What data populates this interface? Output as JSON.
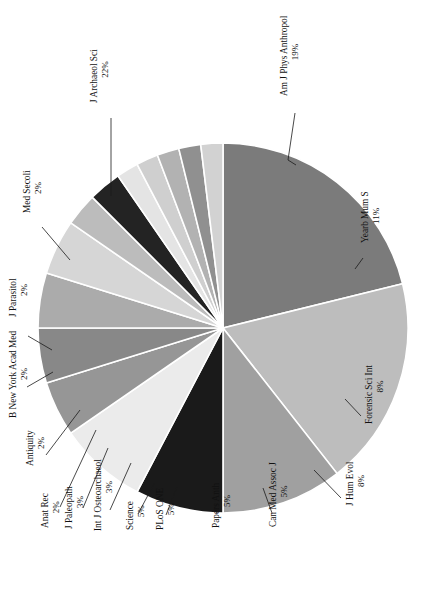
{
  "figure": {
    "name": "journal-distribution-pie-chart",
    "orientation": "rotated-90-ccw",
    "background_color": "#ffffff"
  },
  "chart_data": {
    "type": "pie",
    "title": "",
    "subtitle": "",
    "xlabel": "",
    "ylabel": "",
    "legend_position": "none",
    "labels_position": "outside-with-leader-lines",
    "grid": false,
    "start_angle_deg": 90,
    "direction": "clockwise",
    "total_percent": 100,
    "categories": [
      "J Archaeol Sci",
      "Am J Phys Anthropol",
      "Yearb Mum S",
      "Forensic Sci Int",
      "J Hum Evol",
      "Can Med Assoc J",
      "Papers Anth",
      "PLoS ONE",
      "Science",
      "Int J Osteoarchaeol",
      "J Paleopath",
      "Anat Rec",
      "Antiquity",
      "B New York Acad Med",
      "J Parasitol",
      "Med Secoli"
    ],
    "values": [
      22,
      19,
      11,
      8,
      8,
      5,
      5,
      5,
      5,
      3,
      3,
      2,
      2,
      2,
      2,
      2
    ],
    "value_labels": [
      "22%",
      "19%",
      "11%",
      "8%",
      "8%",
      "5%",
      "5%",
      "5%",
      "5%",
      "3%",
      "3%",
      "2%",
      "2%",
      "2%",
      "2%",
      "2%"
    ],
    "colors": [
      "#7b7b7b",
      "#bdbdbd",
      "#a0a0a0",
      "#1a1a1a",
      "#ebebeb",
      "#969696",
      "#888888",
      "#ababab",
      "#d6d6d6",
      "#bcbcbc",
      "#232323",
      "#e4e4e4",
      "#cfcfcf",
      "#b2b2b2",
      "#909090",
      "#d2d2d2"
    ],
    "slices": [
      {
        "label": "J Archaeol Sci",
        "value": 22,
        "value_label": "22%",
        "color": "#7b7b7b"
      },
      {
        "label": "Am J Phys Anthropol",
        "value": 19,
        "value_label": "19%",
        "color": "#bdbdbd"
      },
      {
        "label": "Yearb Mum S",
        "value": 11,
        "value_label": "11%",
        "color": "#a0a0a0"
      },
      {
        "label": "Forensic Sci Int",
        "value": 8,
        "value_label": "8%",
        "color": "#1a1a1a"
      },
      {
        "label": "J Hum Evol",
        "value": 8,
        "value_label": "8%",
        "color": "#ebebeb"
      },
      {
        "label": "Can Med Assoc J",
        "value": 5,
        "value_label": "5%",
        "color": "#969696"
      },
      {
        "label": "Papers Anth",
        "value": 5,
        "value_label": "5%",
        "color": "#888888"
      },
      {
        "label": "PLoS ONE",
        "value": 5,
        "value_label": "5%",
        "color": "#ababab"
      },
      {
        "label": "Science",
        "value": 5,
        "value_label": "5%",
        "color": "#d6d6d6"
      },
      {
        "label": "Int J Osteoarchaeol",
        "value": 3,
        "value_label": "3%",
        "color": "#bcbcbc"
      },
      {
        "label": "J Paleopath",
        "value": 3,
        "value_label": "3%",
        "color": "#232323"
      },
      {
        "label": "Anat Rec",
        "value": 2,
        "value_label": "2%",
        "color": "#e4e4e4"
      },
      {
        "label": "Antiquity",
        "value": 2,
        "value_label": "2%",
        "color": "#cfcfcf"
      },
      {
        "label": "B New York Acad Med",
        "value": 2,
        "value_label": "2%",
        "color": "#b2b2b2"
      },
      {
        "label": "J Parasitol",
        "value": 2,
        "value_label": "2%",
        "color": "#909090"
      },
      {
        "label": "Med Secoli",
        "value": 2,
        "value_label": "2%",
        "color": "#d2d2d2"
      }
    ]
  },
  "geometry": {
    "center_x": 223,
    "center_y": 328,
    "radius": 185
  },
  "label_layout": [
    {
      "key": "J Archaeol Sci",
      "tx": 97,
      "ty": 103,
      "leader": [
        [
          111,
          118
        ],
        [
          111,
          196
        ]
      ]
    },
    {
      "key": "Am J Phys Anthropol",
      "tx": 287,
      "ty": 96,
      "leader": [
        [
          295,
          113
        ],
        [
          288,
          160
        ],
        [
          296,
          165
        ]
      ]
    },
    {
      "key": "Yearb Mum S",
      "tx": 368,
      "ty": 243,
      "leader": [
        [
          363,
          258
        ],
        [
          355,
          269
        ]
      ]
    },
    {
      "key": "Forensic Sci Int",
      "tx": 372,
      "ty": 424,
      "leader": [
        [
          361,
          416
        ],
        [
          345,
          399
        ]
      ]
    },
    {
      "key": "J Hum Evol",
      "tx": 353,
      "ty": 506,
      "leader": [
        [
          341,
          498
        ],
        [
          314,
          470
        ]
      ]
    },
    {
      "key": "Can Med Assoc J",
      "tx": 276,
      "ty": 527,
      "leader": [
        [
          272,
          513
        ],
        [
          263,
          488
        ]
      ]
    },
    {
      "key": "Papers Anth",
      "tx": 219,
      "ty": 528,
      "leader": [
        [
          217,
          513
        ],
        [
          213,
          490
        ]
      ]
    },
    {
      "key": "PLoS ONE",
      "tx": 163,
      "ty": 530,
      "leader": [
        [
          166,
          515
        ],
        [
          177,
          487
        ]
      ]
    },
    {
      "key": "Science",
      "tx": 133,
      "ty": 530,
      "leader": [
        [
          138,
          514
        ],
        [
          155,
          482
        ]
      ]
    },
    {
      "key": "Int J Osteoarchaeol",
      "tx": 101,
      "ty": 531,
      "leader": [
        [
          110,
          510
        ],
        [
          131,
          463
        ]
      ]
    },
    {
      "key": "J Paleopath",
      "tx": 72,
      "ty": 529,
      "leader": [
        [
          83,
          508
        ],
        [
          108,
          448
        ]
      ]
    },
    {
      "key": "Anat Rec",
      "tx": 48,
      "ty": 528,
      "leader": [
        [
          60,
          507
        ],
        [
          96,
          430
        ]
      ]
    },
    {
      "key": "Antiquity",
      "tx": 33,
      "ty": 466,
      "leader": [
        [
          46,
          455
        ],
        [
          80,
          410
        ]
      ]
    },
    {
      "key": "B New York Acad Med",
      "tx": 16,
      "ty": 418,
      "leader": [
        [
          27,
          387
        ],
        [
          53,
          372
        ]
      ]
    },
    {
      "key": "J Parasitol",
      "tx": 16,
      "ty": 317,
      "leader": [
        [
          28,
          336
        ],
        [
          52,
          350
        ]
      ]
    },
    {
      "key": "Med Secoli",
      "tx": 30,
      "ty": 213,
      "leader": [
        [
          42,
          227
        ],
        [
          70,
          260
        ]
      ]
    }
  ]
}
